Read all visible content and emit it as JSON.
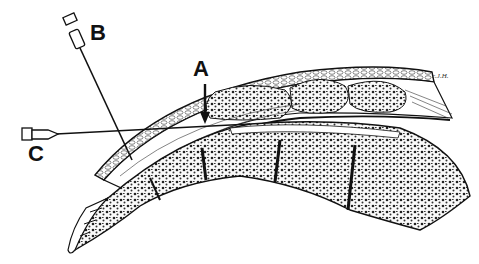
{
  "figure": {
    "type": "anatomical illustration",
    "labels": {
      "a": "A",
      "b": "B",
      "c": "C"
    },
    "signature": "c.J.H.",
    "colors": {
      "ink": "#111111",
      "background": "#ffffff",
      "bone_fill": "#f4f4f4"
    }
  }
}
